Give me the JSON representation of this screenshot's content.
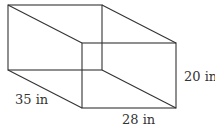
{
  "diagram": {
    "type": "rectangular-prism",
    "labels": {
      "depth": "35 in",
      "width": "28 in",
      "height": "20 in"
    },
    "colors": {
      "stroke": "#333333",
      "text": "#333333",
      "background": "#ffffff"
    }
  }
}
